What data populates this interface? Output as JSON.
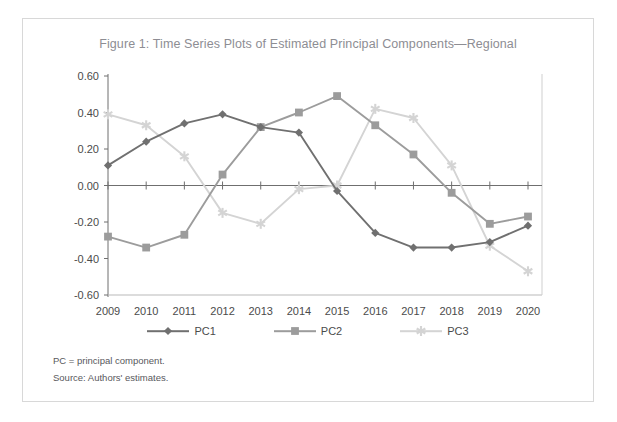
{
  "figure": {
    "title": "Figure 1: Time Series Plots of Estimated Principal Components—Regional",
    "footnote_1": "PC = principal component.",
    "footnote_2": "Source: Authors' estimates."
  },
  "colors": {
    "pc1": "#707070",
    "pc2": "#9c9c9c",
    "pc3": "#d4d4d4",
    "axis": "#6f6f6f",
    "frame_border": "#d8d8d8",
    "title_text": "#8d8d93",
    "tick_text": "#4b4b4b"
  },
  "legend": {
    "position": "bottom-center",
    "entries": [
      {
        "label": "PC1",
        "marker": "diamond",
        "color": "#707070"
      },
      {
        "label": "PC2",
        "marker": "square",
        "color": "#9c9c9c"
      },
      {
        "label": "PC3",
        "marker": "star",
        "color": "#d4d4d4"
      }
    ]
  },
  "chart_data": {
    "type": "line",
    "title": "Figure 1: Time Series Plots of Estimated Principal Components—Regional",
    "xlabel": "",
    "ylabel": "",
    "grid": false,
    "x": [
      2009,
      2010,
      2011,
      2012,
      2013,
      2014,
      2015,
      2016,
      2017,
      2018,
      2019,
      2020
    ],
    "categories": [
      "2009",
      "2010",
      "2011",
      "2012",
      "2013",
      "2014",
      "2015",
      "2016",
      "2017",
      "2018",
      "2019",
      "2020"
    ],
    "xtick_labels": [
      "2009",
      "2010",
      "2011",
      "2012",
      "2013",
      "2014",
      "2015",
      "2016",
      "2017",
      "2018",
      "2019",
      "2020"
    ],
    "ytick_labels": [
      "0.60",
      "0.40",
      "0.20",
      "0.00",
      "-0.20",
      "-0.40",
      "-0.60"
    ],
    "yticks": [
      0.6,
      0.4,
      0.2,
      0.0,
      -0.2,
      -0.4,
      -0.6
    ],
    "ylim": [
      -0.6,
      0.6
    ],
    "xlim": [
      2009,
      2020
    ],
    "series": [
      {
        "name": "PC1",
        "marker": "diamond",
        "color": "#707070",
        "values": [
          0.11,
          0.24,
          0.34,
          0.39,
          0.32,
          0.29,
          -0.03,
          -0.26,
          -0.34,
          -0.34,
          -0.31,
          -0.22
        ]
      },
      {
        "name": "PC2",
        "marker": "square",
        "color": "#9c9c9c",
        "values": [
          -0.28,
          -0.34,
          -0.27,
          0.06,
          0.32,
          0.4,
          0.49,
          0.33,
          0.17,
          -0.04,
          -0.21,
          -0.17
        ]
      },
      {
        "name": "PC3",
        "marker": "star",
        "color": "#d4d4d4",
        "values": [
          0.39,
          0.33,
          0.16,
          -0.15,
          -0.21,
          -0.02,
          0.0,
          0.42,
          0.37,
          0.11,
          -0.33,
          -0.47
        ]
      }
    ]
  }
}
